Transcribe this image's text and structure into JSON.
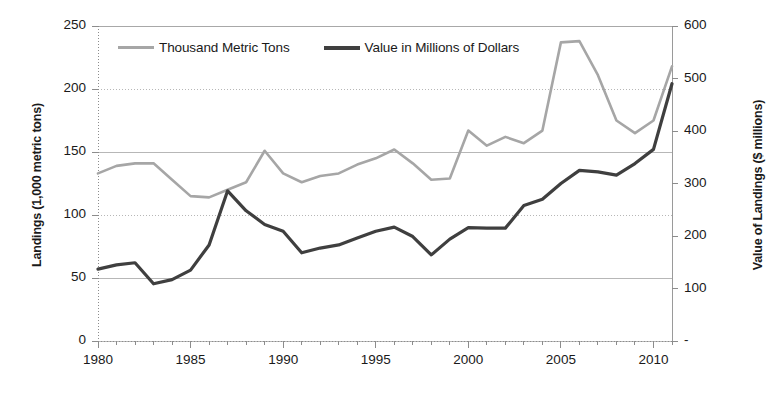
{
  "chart_data": {
    "type": "line",
    "title": "",
    "subtitle": "",
    "xlabel": "",
    "ylabel": "Landings (1,000 metric tons)",
    "y2label": "Value of Landings ($ millions)",
    "grid": true,
    "legend_position": "top-inside",
    "xlim": [
      1980,
      2011
    ],
    "ylim": [
      0,
      250
    ],
    "y2lim": [
      0,
      600
    ],
    "xticks": [
      1980,
      1985,
      1990,
      1995,
      2000,
      2005,
      2010
    ],
    "xticklabels": [
      "1980",
      "1985",
      "1990",
      "1995",
      "2000",
      "2005",
      "2010"
    ],
    "yticks": [
      0,
      50,
      100,
      150,
      200,
      250
    ],
    "yticklabels": [
      "0",
      "50",
      "100",
      "150",
      "200",
      "250"
    ],
    "y2ticks": [
      0,
      100,
      200,
      300,
      400,
      500,
      600
    ],
    "y2ticklabels": [
      "-",
      "100",
      "200",
      "300",
      "400",
      "500",
      "600"
    ],
    "x": [
      1980,
      1981,
      1982,
      1983,
      1984,
      1985,
      1986,
      1987,
      1988,
      1989,
      1990,
      1991,
      1992,
      1993,
      1994,
      1995,
      1996,
      1997,
      1998,
      1999,
      2000,
      2001,
      2002,
      2003,
      2004,
      2005,
      2006,
      2007,
      2008,
      2009,
      2010,
      2011
    ],
    "series": [
      {
        "name": "Thousand Metric Tons",
        "axis": "left",
        "color": "#a6a6a6",
        "values": [
          133,
          139,
          141,
          141,
          128,
          115,
          114,
          120,
          126,
          151,
          133,
          126,
          131,
          133,
          140,
          145,
          152,
          141,
          128,
          129,
          167,
          155,
          162,
          157,
          167,
          237,
          238,
          211,
          175,
          165,
          175,
          218
        ]
      },
      {
        "name": "Value in Millions of Dollars",
        "axis": "right",
        "color": "#3f3f3f",
        "values": [
          137,
          145,
          149,
          109,
          117,
          135,
          183,
          286,
          248,
          222,
          209,
          168,
          177,
          183,
          196,
          209,
          217,
          199,
          164,
          194,
          216,
          215,
          215,
          258,
          270,
          300,
          325,
          322,
          316,
          338,
          365,
          490
        ]
      }
    ]
  },
  "legend": {
    "entries": [
      {
        "label": "Thousand Metric Tons",
        "color": "#a6a6a6"
      },
      {
        "label": "Value in Millions of Dollars",
        "color": "#3f3f3f"
      }
    ]
  }
}
